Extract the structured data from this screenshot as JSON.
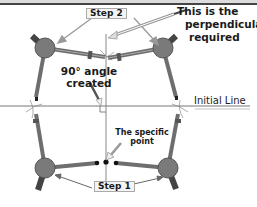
{
  "diagram": {
    "labels": {
      "step1": "Step 1",
      "step2": "Step 2",
      "perpendicular_line1": "This is the",
      "perpendicular_line2": "perpendicular",
      "perpendicular_line3": "required",
      "angle_line1": "90° angle",
      "angle_line2": "created",
      "initial_line": "Initial Line",
      "point_line1": "The specific",
      "point_line2": "point"
    },
    "colors": {
      "compass_arm": "#6e6e6e",
      "compass_hinge": "#7a7a7a",
      "line": "#777777",
      "arrow": "#888888",
      "pointer": "#555555"
    }
  }
}
